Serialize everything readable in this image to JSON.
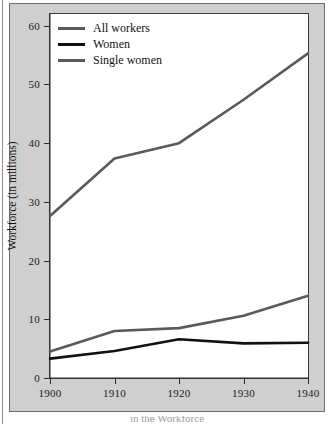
{
  "chart_data": {
    "type": "line",
    "title": "",
    "xlabel": "",
    "ylabel": "Workforce (in millions)",
    "x": [
      1900,
      1910,
      1920,
      1930,
      1940
    ],
    "xticklabels": [
      "1900",
      "1910",
      "1920",
      "1930",
      "1940"
    ],
    "yticks": [
      0,
      10,
      20,
      30,
      40,
      50,
      60
    ],
    "yticklabels": [
      "0",
      "10",
      "20",
      "30",
      "40",
      "50",
      "60"
    ],
    "xlim": [
      1900,
      1940
    ],
    "ylim": [
      0,
      62
    ],
    "grid": false,
    "legend_position": "upper-left",
    "series": [
      {
        "name": "All workers",
        "color": "#5a5a5a",
        "width": 2.6,
        "values": [
          27.6,
          37.4,
          40.0,
          47.4,
          55.3
        ]
      },
      {
        "name": "Women",
        "color": "#111111",
        "width": 2.6,
        "values": [
          3.3,
          4.6,
          6.6,
          5.9,
          6.0
        ]
      },
      {
        "name": "Single women",
        "color": "#5a5a5a",
        "width": 2.6,
        "values": [
          4.5,
          8.0,
          8.5,
          10.6,
          14.0
        ]
      }
    ]
  },
  "legend": {
    "items": [
      {
        "label": "All workers",
        "color": "#5a5a5a"
      },
      {
        "label": "Women",
        "color": "#111111"
      },
      {
        "label": "Single women",
        "color": "#5a5a5a"
      }
    ]
  },
  "axes": {
    "y_title": "Workforce (in millions)"
  },
  "caption": {
    "text": "in the Workforce"
  },
  "colors": {
    "panel_background": "#cfcfcf",
    "plot_background": "#ffffff",
    "frame_border": "#3a3a3a",
    "axis_text": "#1a1a1a",
    "series_gray": "#5a5a5a",
    "series_black": "#111111"
  }
}
